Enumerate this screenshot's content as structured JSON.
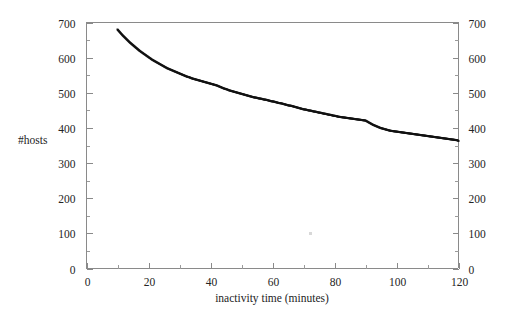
{
  "figure": {
    "background_color": "#ffffff",
    "frame_color": "#8a8a8a",
    "marker_color": "#121212",
    "ylabel": "#hosts",
    "xlabel": "inactivity time (minutes)"
  },
  "chart_data": {
    "type": "scatter",
    "title": "",
    "subtitle": "",
    "xlabel": "inactivity time (minutes)",
    "ylabel": "#hosts",
    "xlim": [
      0,
      120
    ],
    "ylim": [
      0,
      700
    ],
    "grid": false,
    "legend": null,
    "legend_position": "none",
    "x_major_ticks": [
      0,
      20,
      40,
      60,
      80,
      100,
      120
    ],
    "x_minor_ticks": [
      10,
      30,
      50,
      70,
      90,
      110
    ],
    "x_ticklabels": [
      "0",
      "20",
      "40",
      "60",
      "80",
      "100",
      "120"
    ],
    "y_major_ticks": [
      0,
      100,
      200,
      300,
      400,
      500,
      600,
      700
    ],
    "y_minor_ticks": [
      50,
      150,
      250,
      350,
      450,
      550,
      650
    ],
    "y_ticklabels": [
      "0",
      "100",
      "200",
      "300",
      "400",
      "500",
      "600",
      "700"
    ],
    "y_axis_right_mirrored": true,
    "y_ticklabels_right": [
      "0",
      "100",
      "200",
      "300",
      "400",
      "500",
      "600",
      "700"
    ],
    "marker": "square",
    "marker_size": 2,
    "series": [
      {
        "name": "hosts",
        "color": "#121212",
        "x": [
          10,
          10.8,
          11.6,
          12.4,
          13.2,
          14,
          14.8,
          15.6,
          16.4,
          17.2,
          18,
          18.8,
          19.6,
          20.4,
          21.2,
          22,
          22.8,
          23.6,
          24.4,
          25.2,
          26,
          26.8,
          27.6,
          28.4,
          29.2,
          30,
          30.8,
          31.6,
          32.4,
          33.2,
          34,
          34.8,
          35.6,
          36.4,
          37.2,
          38,
          38.8,
          39.6,
          40.4,
          41.2,
          42,
          42.8,
          43.6,
          44.4,
          45.2,
          46,
          46.8,
          47.6,
          48.4,
          49.2,
          50,
          50.8,
          51.6,
          52.4,
          53.2,
          54,
          54.8,
          55.6,
          56.4,
          57.2,
          58,
          58.8,
          59.6,
          60.4,
          61.2,
          62,
          62.8,
          63.6,
          64.4,
          65.2,
          66,
          66.8,
          67.6,
          68.4,
          69.2,
          70,
          70.8,
          71.6,
          72.4,
          73.2,
          74,
          74.8,
          75.6,
          76.4,
          77.2,
          78,
          78.8,
          79.6,
          80.4,
          81.2,
          82,
          82.8,
          83.6,
          84.4,
          85.2,
          86,
          86.8,
          87.6,
          88.4,
          89.2,
          90,
          90.8,
          91.6,
          92.4,
          93.2,
          94,
          94.8,
          95.6,
          96.4,
          97.2,
          98,
          98.8,
          99.6,
          100.4,
          101.2,
          102,
          102.8,
          103.6,
          104.4,
          105.2,
          106,
          106.8,
          107.6,
          108.4,
          109.2,
          110,
          110.8,
          111.6,
          112.4,
          113.2,
          114,
          114.8,
          115.6,
          116.4,
          117.2,
          118,
          118.8,
          119.6,
          120
        ],
        "y": [
          680,
          672,
          664,
          657,
          650,
          643,
          637,
          631,
          625,
          619,
          614,
          609,
          604,
          599,
          594,
          590,
          586,
          582,
          578,
          574,
          570,
          567,
          564,
          561,
          558,
          555,
          552,
          549,
          546,
          544,
          541,
          539,
          537,
          535,
          533,
          531,
          529,
          527,
          525,
          523,
          521,
          518,
          515,
          512,
          510,
          507,
          505,
          503,
          501,
          499,
          497,
          495,
          493,
          491,
          489,
          487,
          486,
          484,
          483,
          481,
          480,
          478,
          476,
          475,
          473,
          471,
          470,
          468,
          466,
          464,
          463,
          461,
          459,
          457,
          455,
          453,
          452,
          450,
          449,
          447,
          446,
          444,
          443,
          441,
          440,
          438,
          437,
          435,
          434,
          432,
          431,
          430,
          429,
          428,
          427,
          426,
          425,
          424,
          423,
          422,
          421,
          417,
          413,
          409,
          406,
          403,
          400,
          398,
          396,
          394,
          392,
          391,
          390,
          389,
          388,
          387,
          386,
          385,
          384,
          383,
          382,
          381,
          380,
          379,
          378,
          377,
          376,
          375,
          374,
          373,
          372,
          371,
          370,
          369,
          368,
          367,
          366,
          365,
          363
        ]
      }
    ]
  }
}
